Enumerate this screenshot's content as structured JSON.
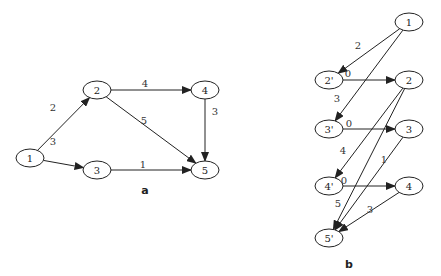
{
  "diagrams": [
    {
      "id": "a",
      "caption": "a",
      "caption_pos": [
        145,
        190
      ],
      "nodes": [
        {
          "id": "1",
          "label": "1",
          "x": 30,
          "y": 158
        },
        {
          "id": "2",
          "label": "2",
          "x": 97,
          "y": 90
        },
        {
          "id": "3",
          "label": "3",
          "x": 97,
          "y": 170
        },
        {
          "id": "4",
          "label": "4",
          "x": 205,
          "y": 90
        },
        {
          "id": "5",
          "label": "5",
          "x": 205,
          "y": 170
        }
      ],
      "edges": [
        {
          "from": "1",
          "to": "2",
          "weight": "2",
          "label_pos": [
            53,
            107
          ]
        },
        {
          "from": "1",
          "to": "3",
          "weight": "3",
          "label_pos": [
            53,
            141
          ]
        },
        {
          "from": "2",
          "to": "4",
          "weight": "4",
          "label_pos": [
            145,
            83
          ]
        },
        {
          "from": "2",
          "to": "5",
          "weight": "5",
          "label_pos": [
            144,
            120
          ]
        },
        {
          "from": "4",
          "to": "5",
          "weight": "3",
          "label_pos": [
            215,
            111
          ]
        },
        {
          "from": "3",
          "to": "5",
          "weight": "1",
          "label_pos": [
            143,
            164
          ]
        }
      ]
    },
    {
      "id": "b",
      "caption": "b",
      "caption_pos": [
        349,
        264
      ],
      "nodes": [
        {
          "id": "1",
          "label": "1",
          "x": 409,
          "y": 22
        },
        {
          "id": "2'",
          "label": "2'",
          "x": 329,
          "y": 80
        },
        {
          "id": "2",
          "label": "2",
          "x": 409,
          "y": 80
        },
        {
          "id": "3'",
          "label": "3'",
          "x": 329,
          "y": 129
        },
        {
          "id": "3",
          "label": "3",
          "x": 409,
          "y": 129
        },
        {
          "id": "4'",
          "label": "4'",
          "x": 329,
          "y": 186
        },
        {
          "id": "4",
          "label": "4",
          "x": 409,
          "y": 186
        },
        {
          "id": "5'",
          "label": "5'",
          "x": 329,
          "y": 238
        }
      ],
      "edges": [
        {
          "from": "1",
          "to": "2'",
          "weight": "2",
          "label_pos": [
            358,
            45
          ]
        },
        {
          "from": "1",
          "to": "3'",
          "weight": "3",
          "label_pos": [
            337,
            98
          ]
        },
        {
          "from": "2'",
          "to": "2",
          "weight": "0",
          "label_pos": [
            348,
            73
          ]
        },
        {
          "from": "3'",
          "to": "3",
          "weight": "0",
          "label_pos": [
            349,
            123
          ]
        },
        {
          "from": "2",
          "to": "4'",
          "weight": "4",
          "label_pos": [
            343,
            150
          ]
        },
        {
          "from": "4'",
          "to": "4",
          "weight": "0",
          "label_pos": [
            344,
            180
          ]
        },
        {
          "from": "3",
          "to": "5'",
          "weight": "1",
          "label_pos": [
            384,
            159
          ]
        },
        {
          "from": "2",
          "to": "5'",
          "weight": "5",
          "label_pos": [
            338,
            203
          ]
        },
        {
          "from": "4",
          "to": "5'",
          "weight": "3",
          "label_pos": [
            370,
            209
          ]
        }
      ]
    }
  ]
}
